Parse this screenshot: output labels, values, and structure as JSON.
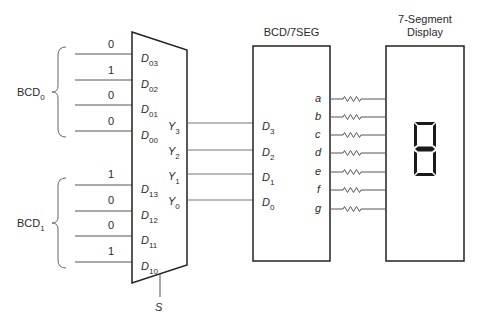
{
  "diagram": {
    "type": "BCD multiplexer driving 7-segment display",
    "groups": [
      {
        "name": "BCD",
        "sub": "0",
        "inputs": [
          {
            "name": "D",
            "sub": "03",
            "value": "0"
          },
          {
            "name": "D",
            "sub": "02",
            "value": "1"
          },
          {
            "name": "D",
            "sub": "01",
            "value": "0"
          },
          {
            "name": "D",
            "sub": "00",
            "value": "0"
          }
        ]
      },
      {
        "name": "BCD",
        "sub": "1",
        "inputs": [
          {
            "name": "D",
            "sub": "13",
            "value": "1"
          },
          {
            "name": "D",
            "sub": "12",
            "value": "0"
          },
          {
            "name": "D",
            "sub": "11",
            "value": "0"
          },
          {
            "name": "D",
            "sub": "10",
            "value": "1"
          }
        ]
      }
    ],
    "mux": {
      "outputs": [
        {
          "name": "Y",
          "sub": "3"
        },
        {
          "name": "Y",
          "sub": "2"
        },
        {
          "name": "Y",
          "sub": "1"
        },
        {
          "name": "Y",
          "sub": "0"
        }
      ],
      "select": "S"
    },
    "decoder": {
      "title": "BCD/7SEG",
      "inputs": [
        {
          "name": "D",
          "sub": "3"
        },
        {
          "name": "D",
          "sub": "2"
        },
        {
          "name": "D",
          "sub": "1"
        },
        {
          "name": "D",
          "sub": "0"
        }
      ],
      "outputs": [
        "a",
        "b",
        "c",
        "d",
        "e",
        "f",
        "g"
      ]
    },
    "display": {
      "title_line1": "7-Segment",
      "title_line2": "Display"
    }
  }
}
